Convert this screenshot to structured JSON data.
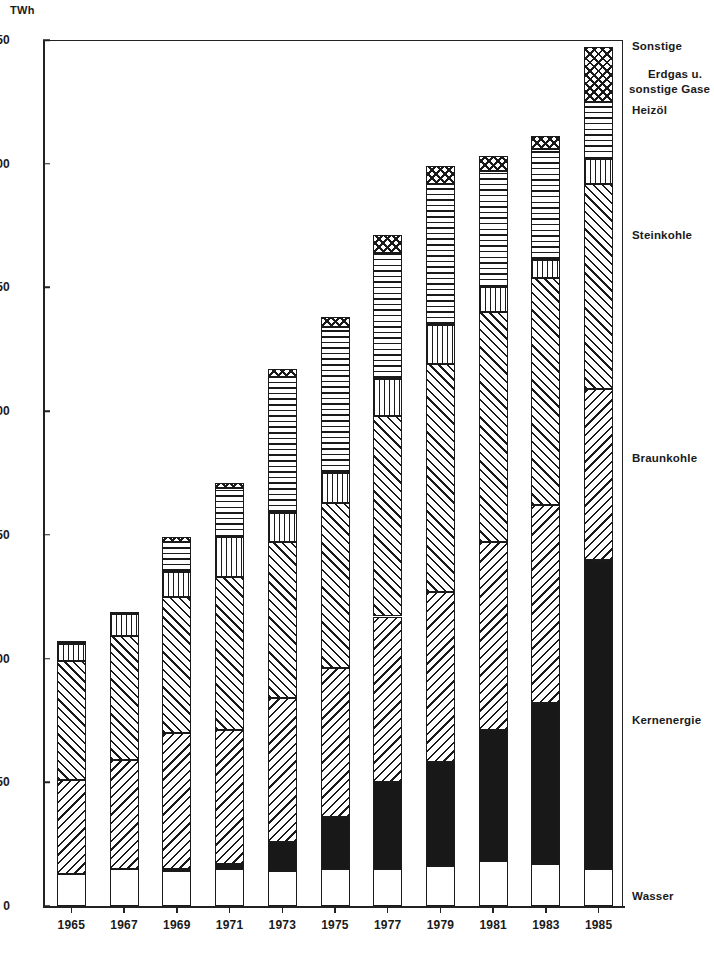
{
  "chart_data": {
    "type": "bar",
    "subtype": "stacked-bar",
    "title": "",
    "xlabel": "",
    "ylabel": "TWh",
    "unit_label": "TWh",
    "ylim": [
      0,
      350
    ],
    "ytick_step": 50,
    "yticks": [
      0,
      50,
      100,
      150,
      200,
      250,
      300,
      350
    ],
    "ytick_labels": [
      "0",
      "50",
      "100",
      "150",
      "200",
      "250",
      "300",
      "350"
    ],
    "grid": false,
    "legend_position": "right-inline",
    "categories": [
      "1965",
      "1967",
      "1969",
      "1971",
      "1973",
      "1975",
      "1977",
      "1979",
      "1981",
      "1983",
      "1985"
    ],
    "series": [
      {
        "name": "Wasser",
        "pattern": "white",
        "values": [
          13,
          15,
          14,
          15,
          14,
          15,
          15,
          16,
          18,
          17,
          15
        ]
      },
      {
        "name": "Kernenergie",
        "pattern": "solid-black",
        "values": [
          0,
          0,
          1,
          2,
          12,
          21,
          35,
          42,
          53,
          65,
          125
        ]
      },
      {
        "name": "Braunkohle",
        "pattern": "diagonal-back",
        "values": [
          38,
          44,
          55,
          54,
          58,
          60,
          67,
          69,
          76,
          80,
          69
        ]
      },
      {
        "name": "Steinkohle",
        "pattern": "diagonal-fwd",
        "values": [
          48,
          50,
          55,
          62,
          63,
          67,
          81,
          92,
          93,
          92,
          83
        ]
      },
      {
        "name": "Heizöl",
        "pattern": "vertical-grid",
        "values": [
          7,
          9,
          10,
          16,
          12,
          12,
          15,
          16,
          10,
          7,
          10
        ]
      },
      {
        "name": "Erdgas u. sonstige Gase",
        "pattern": "horizontal-lines",
        "values": [
          1,
          1,
          12,
          20,
          55,
          59,
          51,
          57,
          47,
          45,
          23
        ]
      },
      {
        "name": "Sonstige",
        "pattern": "dotted-cross",
        "values": [
          0,
          0,
          2,
          2,
          3,
          4,
          7,
          7,
          6,
          5,
          22
        ]
      }
    ],
    "totals": [
      107,
      119,
      149,
      171,
      217,
      238,
      271,
      299,
      303,
      311,
      347
    ],
    "annotations": []
  },
  "legend": {
    "entries": [
      {
        "key": "sonstige",
        "label": "Sonstige"
      },
      {
        "key": "erdgas_l1",
        "label": "Erdgas u."
      },
      {
        "key": "erdgas_l2",
        "label": "sonstige Gase"
      },
      {
        "key": "heizoel",
        "label": "Heizöl"
      },
      {
        "key": "steinkohle",
        "label": "Steinkohle"
      },
      {
        "key": "braunkohle",
        "label": "Braunkohle"
      },
      {
        "key": "kernenergie",
        "label": "Kernenergie"
      },
      {
        "key": "wasser",
        "label": "Wasser"
      }
    ]
  },
  "colors": {
    "ink": "#1a1a1a",
    "axis": "#222222",
    "background": "#ffffff",
    "kernenergie_fill": "#181818"
  }
}
